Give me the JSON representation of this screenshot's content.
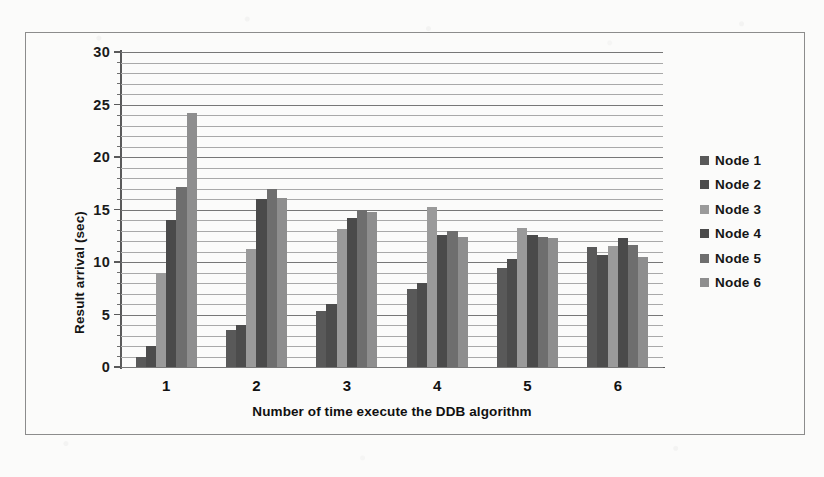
{
  "chart_data": {
    "type": "bar",
    "title": "",
    "xlabel": "Number of time execute the DDB algorithm",
    "ylabel": "Result arrival (sec)",
    "categories": [
      "1",
      "2",
      "3",
      "4",
      "5",
      "6"
    ],
    "ylim": [
      0,
      30
    ],
    "ytick_labels": [
      "0",
      "5",
      "10",
      "15",
      "20",
      "25",
      "30"
    ],
    "ytick_values": [
      0,
      5,
      10,
      15,
      20,
      25,
      30
    ],
    "grid": "horizontal, minor gridlines every 1 sec",
    "legend_position": "right",
    "series": [
      {
        "name": "Node 1",
        "color": "#595959",
        "values": [
          1.0,
          3.5,
          5.3,
          7.4,
          9.4,
          11.4
        ]
      },
      {
        "name": "Node 2",
        "color": "#4c4c4c",
        "values": [
          2.0,
          4.0,
          6.0,
          8.0,
          10.3,
          10.7
        ]
      },
      {
        "name": "Node 3",
        "color": "#9a9a9a",
        "values": [
          9.0,
          11.2,
          13.1,
          15.2,
          13.2,
          11.5
        ]
      },
      {
        "name": "Node 4",
        "color": "#4a4a4a",
        "values": [
          14.0,
          16.0,
          14.2,
          12.6,
          12.6,
          12.3
        ]
      },
      {
        "name": "Node 5",
        "color": "#6e6e6e",
        "values": [
          17.1,
          17.0,
          15.0,
          13.0,
          12.4,
          11.6
        ]
      },
      {
        "name": "Node 6",
        "color": "#8e8e8e",
        "values": [
          24.2,
          16.1,
          14.8,
          12.4,
          12.3,
          10.5
        ]
      }
    ]
  },
  "legend": {
    "items": [
      {
        "label": "Node 1"
      },
      {
        "label": "Node 2"
      },
      {
        "label": "Node 3"
      },
      {
        "label": "Node 4"
      },
      {
        "label": "Node 5"
      },
      {
        "label": "Node 6"
      }
    ]
  }
}
